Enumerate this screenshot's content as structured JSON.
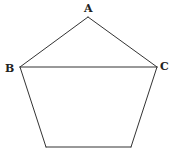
{
  "diagram": {
    "type": "geometry",
    "shape": "pentagon",
    "colors": {
      "line": "#333333",
      "label": "#222222",
      "background": "#ffffff"
    },
    "vertices": [
      {
        "name": "A",
        "x": 88,
        "y": 17,
        "label_x": 85,
        "label_y": 13
      },
      {
        "name": "B",
        "x": 20,
        "y": 67,
        "label_x": 4,
        "label_y": 71
      },
      {
        "name": "C",
        "x": 157,
        "y": 67,
        "label_x": 160,
        "label_y": 70
      },
      {
        "name": "",
        "x": 46,
        "y": 147
      },
      {
        "name": "",
        "x": 131,
        "y": 147
      }
    ],
    "edges": [
      [
        "A",
        "B"
      ],
      [
        "A",
        "C"
      ],
      [
        "B",
        "C"
      ],
      [
        "B",
        "D"
      ],
      [
        "C",
        "E"
      ],
      [
        "D",
        "E"
      ]
    ],
    "labels": {
      "a": "A",
      "b": "B",
      "c": "C"
    }
  }
}
